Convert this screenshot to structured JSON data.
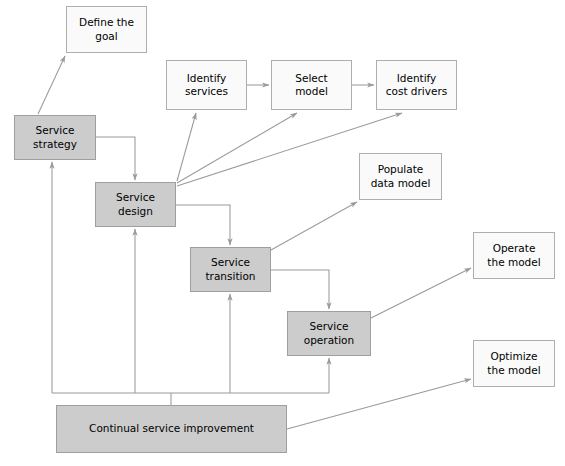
{
  "diagram": {
    "colors": {
      "filled_fill": "#cccccc",
      "plain_fill": "#fafafa",
      "box_stroke": "#a6a6a6",
      "edge_stroke": "#9a9a9a",
      "text": "#000000",
      "background": "#ffffff"
    },
    "nodes": [
      {
        "id": "define-the-goal",
        "label": "Define the\ngoal",
        "style": "plain",
        "x": 66,
        "y": 6,
        "w": 81,
        "h": 47
      },
      {
        "id": "identify-services",
        "label": "Identify\nservices",
        "style": "plain",
        "x": 166,
        "y": 60,
        "w": 81,
        "h": 50
      },
      {
        "id": "select-model",
        "label": "Select\nmodel",
        "style": "plain",
        "x": 271,
        "y": 60,
        "w": 81,
        "h": 50
      },
      {
        "id": "identify-cost-drivers",
        "label": "Identify\ncost drivers",
        "style": "plain",
        "x": 376,
        "y": 60,
        "w": 81,
        "h": 50
      },
      {
        "id": "populate-data-model",
        "label": "Populate\ndata model",
        "style": "plain",
        "x": 359,
        "y": 153,
        "w": 83,
        "h": 47
      },
      {
        "id": "operate-the-model",
        "label": "Operate\nthe model",
        "style": "plain",
        "x": 473,
        "y": 232,
        "w": 82,
        "h": 47
      },
      {
        "id": "optimize-the-model",
        "label": "Optimize\nthe model",
        "style": "plain",
        "x": 473,
        "y": 340,
        "w": 82,
        "h": 47
      },
      {
        "id": "service-strategy",
        "label": "Service\nstrategy",
        "style": "filled",
        "x": 14,
        "y": 115,
        "w": 82,
        "h": 45
      },
      {
        "id": "service-design",
        "label": "Service\ndesign",
        "style": "filled",
        "x": 95,
        "y": 182,
        "w": 81,
        "h": 45
      },
      {
        "id": "service-transition",
        "label": "Service\ntransition",
        "style": "filled",
        "x": 190,
        "y": 247,
        "w": 81,
        "h": 45
      },
      {
        "id": "service-operation",
        "label": "Service\noperation",
        "style": "filled",
        "x": 287,
        "y": 311,
        "w": 84,
        "h": 45
      },
      {
        "id": "continual-service-improvement",
        "label": "Continual service improvement",
        "style": "filled",
        "x": 56,
        "y": 405,
        "w": 231,
        "h": 48
      }
    ],
    "edges": [
      {
        "id": "service-strategy-to-define-the-goal",
        "from": "service-strategy",
        "to": "define-the-goal",
        "kind": "diagonal-arrow"
      },
      {
        "id": "service-strategy-to-service-design",
        "from": "service-strategy",
        "to": "service-design",
        "kind": "elbow-arrow"
      },
      {
        "id": "service-design-to-identify-services",
        "from": "service-design",
        "to": "identify-services",
        "kind": "diagonal-arrow"
      },
      {
        "id": "service-design-to-select-model",
        "from": "service-design",
        "to": "select-model",
        "kind": "diagonal-arrow"
      },
      {
        "id": "service-design-to-identify-cost-drivers",
        "from": "service-design",
        "to": "identify-cost-drivers",
        "kind": "diagonal-arrow"
      },
      {
        "id": "identify-services-to-select-model",
        "from": "identify-services",
        "to": "select-model",
        "kind": "straight-arrow"
      },
      {
        "id": "select-model-to-identify-cost-drivers",
        "from": "select-model",
        "to": "identify-cost-drivers",
        "kind": "straight-arrow"
      },
      {
        "id": "service-design-to-service-transition",
        "from": "service-design",
        "to": "service-transition",
        "kind": "elbow-arrow"
      },
      {
        "id": "service-transition-to-populate-data-model",
        "from": "service-transition",
        "to": "populate-data-model",
        "kind": "diagonal-arrow"
      },
      {
        "id": "service-transition-to-service-operation",
        "from": "service-transition",
        "to": "service-operation",
        "kind": "elbow-arrow"
      },
      {
        "id": "service-operation-to-operate-the-model",
        "from": "service-operation",
        "to": "operate-the-model",
        "kind": "diagonal-arrow"
      },
      {
        "id": "continual-service-improvement-to-optimize-the-model",
        "from": "continual-service-improvement",
        "to": "optimize-the-model",
        "kind": "diagonal-arrow"
      },
      {
        "id": "continual-service-improvement-to-service-strategy",
        "from": "continual-service-improvement",
        "to": "service-strategy",
        "kind": "bus-arrow"
      },
      {
        "id": "continual-service-improvement-to-service-design",
        "from": "continual-service-improvement",
        "to": "service-design",
        "kind": "bus-arrow"
      },
      {
        "id": "continual-service-improvement-to-service-transition",
        "from": "continual-service-improvement",
        "to": "service-transition",
        "kind": "bus-arrow"
      },
      {
        "id": "continual-service-improvement-to-service-operation",
        "from": "continual-service-improvement",
        "to": "service-operation",
        "kind": "bus-arrow"
      }
    ]
  }
}
